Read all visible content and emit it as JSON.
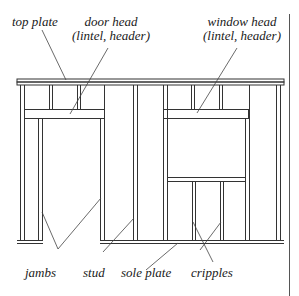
{
  "diagram": {
    "type": "wall-framing",
    "labels": {
      "top_plate": "top plate",
      "door_head_line1": "door head",
      "door_head_line2": "(lintel, header)",
      "window_head_line1": "window head",
      "window_head_line2": "(lintel, header)",
      "jambs": "jambs",
      "stud": "stud",
      "sole_plate": "sole plate",
      "cripples": "cripples"
    },
    "colors": {
      "line": "#333333",
      "background": "#ffffff"
    }
  }
}
